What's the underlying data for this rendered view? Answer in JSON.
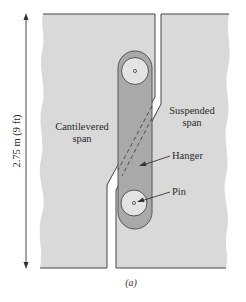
{
  "figure": {
    "caption": "(a)",
    "dimension_label": "2.75 m (9 ft)",
    "labels": {
      "cantilevered_line1": "Cantilevered",
      "cantilevered_line2": "span",
      "suspended_line1": "Suspended",
      "suspended_line2": "span",
      "hanger": "Hanger",
      "pin": "Pin"
    },
    "colors": {
      "span_fill": "#d9d9d9",
      "hanger_fill": "#a9a9a9",
      "pin_fill": "#e3e3e3",
      "outline": "#444444"
    }
  }
}
